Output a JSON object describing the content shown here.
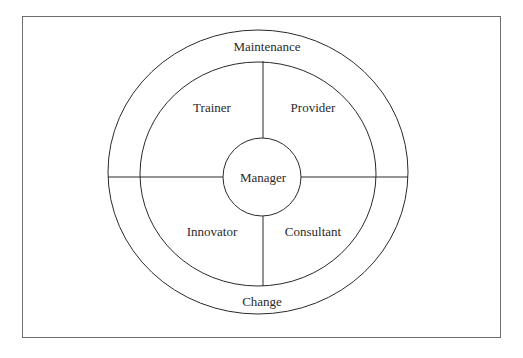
{
  "diagram": {
    "type": "concentric-role-model",
    "outer_ring": {
      "top_label": "Maintenance",
      "bottom_label": "Change"
    },
    "quadrants": [
      {
        "position": "top-left",
        "label": "Trainer"
      },
      {
        "position": "top-right",
        "label": "Provider"
      },
      {
        "position": "bottom-left",
        "label": "Innovator"
      },
      {
        "position": "bottom-right",
        "label": "Consultant"
      }
    ],
    "center": {
      "label": "Manager"
    },
    "colors": {
      "line": "#2a2a2a",
      "frame": "#6e6e6e",
      "background": "#ffffff"
    }
  }
}
